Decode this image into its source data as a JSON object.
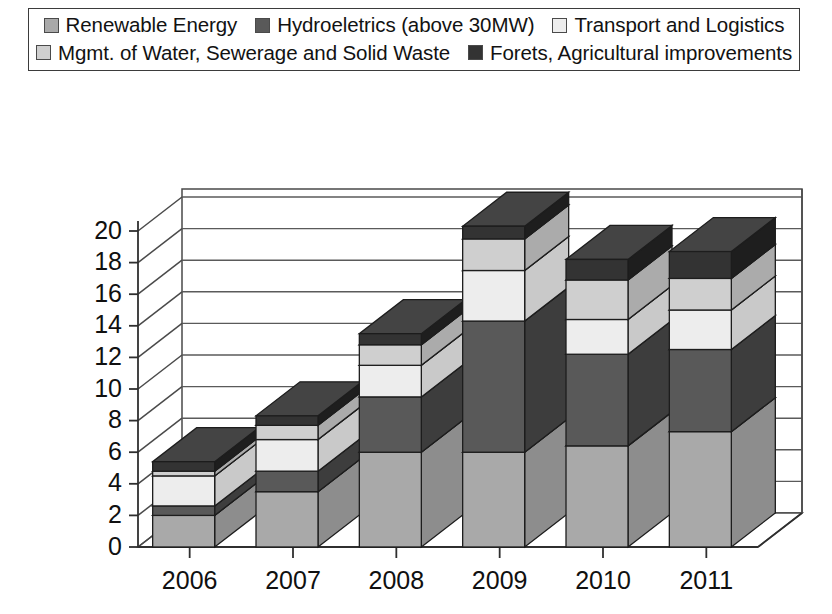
{
  "chart_data": {
    "type": "bar",
    "subtype": "stacked-column-3d",
    "title": "",
    "xlabel": "",
    "ylabel": "",
    "ylim": [
      0,
      20
    ],
    "ytick_step": 2,
    "yticks": [
      "0",
      "2",
      "4",
      "6",
      "8",
      "10",
      "12",
      "14",
      "16",
      "18",
      "20"
    ],
    "grid": true,
    "legend_position": "top",
    "categories": [
      "2006",
      "2007",
      "2008",
      "2009",
      "2010",
      "2011"
    ],
    "series": [
      {
        "name": "Renewable Energy",
        "color": "#a9a9a9",
        "side_color": "#8d8d8d",
        "top_color": "#bdbdbd",
        "values": [
          2.0,
          3.5,
          6.0,
          6.0,
          6.4,
          7.3
        ]
      },
      {
        "name": "Hydroeletrics (above 30MW)",
        "color": "#595959",
        "side_color": "#3d3d3d",
        "top_color": "#6d6d6d",
        "values": [
          0.6,
          1.3,
          3.5,
          8.3,
          5.8,
          5.2
        ]
      },
      {
        "name": "Transport and Logistics",
        "color": "#ededed",
        "side_color": "#c9c9c9",
        "top_color": "#f7f7f7",
        "values": [
          1.9,
          2.0,
          2.0,
          3.2,
          2.2,
          2.5
        ]
      },
      {
        "name": "Mgmt. of Water, Sewerage and Solid Waste",
        "color": "#cfcfcf",
        "side_color": "#ababab",
        "top_color": "#dedede",
        "values": [
          0.3,
          0.9,
          1.3,
          2.0,
          2.5,
          2.0
        ]
      },
      {
        "name": "Forets, Agricultural improvements",
        "color": "#333333",
        "side_color": "#1e1e1e",
        "top_color": "#444444",
        "values": [
          0.6,
          0.6,
          0.7,
          0.8,
          1.3,
          1.7
        ]
      }
    ],
    "totals": [
      5.4,
      8.3,
      13.5,
      20.3,
      18.2,
      18.7
    ]
  },
  "legend": {
    "rows": [
      [
        {
          "label": "Renewable Energy",
          "series_index": 0
        },
        {
          "label": "Hydroeletrics (above 30MW)",
          "series_index": 1
        },
        {
          "label": "Transport and Logistics",
          "series_index": 2
        }
      ],
      [
        {
          "label": "Mgmt. of Water, Sewerage and Solid Waste",
          "series_index": 3
        },
        {
          "label": "Forets, Agricultural improvements",
          "series_index": 4
        }
      ]
    ]
  }
}
